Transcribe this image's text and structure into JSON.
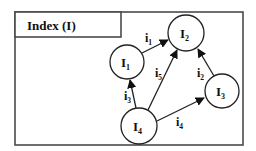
{
  "diagram": {
    "title": "Index (I)",
    "nodes": [
      {
        "id": "I1",
        "base": "I",
        "sub": "1",
        "cx": 127,
        "cy": 62,
        "r": 17
      },
      {
        "id": "I2",
        "base": "I",
        "sub": "2",
        "cx": 186,
        "cy": 33,
        "r": 18
      },
      {
        "id": "I3",
        "base": "I",
        "sub": "3",
        "cx": 222,
        "cy": 91,
        "r": 17
      },
      {
        "id": "I4",
        "base": "I",
        "sub": "4",
        "cx": 139,
        "cy": 126,
        "r": 18
      }
    ],
    "edges": [
      {
        "id": "i1",
        "base": "i",
        "sub": "1",
        "from": "I1",
        "to": "I2"
      },
      {
        "id": "i2",
        "base": "i",
        "sub": "2",
        "from": "I3",
        "to": "I2"
      },
      {
        "id": "i3",
        "base": "i",
        "sub": "3",
        "from": "I4",
        "to": "I1"
      },
      {
        "id": "i4",
        "base": "i",
        "sub": "4",
        "from": "I4",
        "to": "I3"
      },
      {
        "id": "i5",
        "base": "i",
        "sub": "5",
        "from": "I4",
        "to": "I2"
      }
    ]
  }
}
